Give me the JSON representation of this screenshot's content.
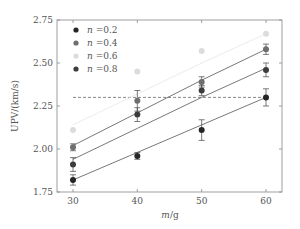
{
  "chart_data": {
    "type": "scatter",
    "title": "",
    "xlabel": "m/g",
    "ylabel": "UPV/(km/s)",
    "xlim": [
      27.5,
      62.5
    ],
    "ylim": [
      1.75,
      2.75
    ],
    "x_ticks": [
      30,
      40,
      50,
      60
    ],
    "y_ticks": [
      1.75,
      2.0,
      2.25,
      2.5,
      2.75
    ],
    "y_tick_labels": [
      "1.75",
      "2.00",
      "2.25",
      "2.50",
      "2.75"
    ],
    "x_tick_labels": [
      "30",
      "40",
      "50",
      "60"
    ],
    "grid": false,
    "legend_position": "upper left",
    "x": [
      30,
      40,
      50,
      60
    ],
    "series": [
      {
        "name": "n=0.2",
        "var": "n",
        "value_label": "=0.2",
        "color": "#262626",
        "values": [
          1.82,
          1.96,
          2.11,
          2.3
        ],
        "errors": [
          0.03,
          0.02,
          0.06,
          0.05
        ],
        "fit": [
          1.82,
          1.98,
          2.14,
          2.3
        ]
      },
      {
        "name": "n=0.4",
        "var": "n",
        "value_label": "=0.4",
        "color": "#6e6e6e",
        "values": [
          2.01,
          2.28,
          2.39,
          2.58
        ],
        "errors": [
          0.02,
          0.06,
          0.03,
          0.03
        ],
        "fit": [
          2.02,
          2.21,
          2.4,
          2.58
        ]
      },
      {
        "name": "n=0.6",
        "var": "n",
        "value_label": "=0.6",
        "color": "#dcdcdc",
        "values": [
          2.11,
          2.45,
          2.57,
          2.67
        ],
        "errors": [
          0.01,
          0.01,
          0.01,
          0.01
        ],
        "fit": [
          2.14,
          2.32,
          2.5,
          2.67
        ]
      },
      {
        "name": "n=0.8",
        "var": "n",
        "value_label": "=0.8",
        "color": "#3c3c3c",
        "values": [
          1.91,
          2.2,
          2.34,
          2.46
        ],
        "errors": [
          0.04,
          0.04,
          0.03,
          0.04
        ],
        "fit": [
          1.94,
          2.12,
          2.3,
          2.47
        ]
      }
    ],
    "reference_line": {
      "y": 2.3,
      "style": "dashed",
      "x_from": 30,
      "x_to": 60
    }
  }
}
